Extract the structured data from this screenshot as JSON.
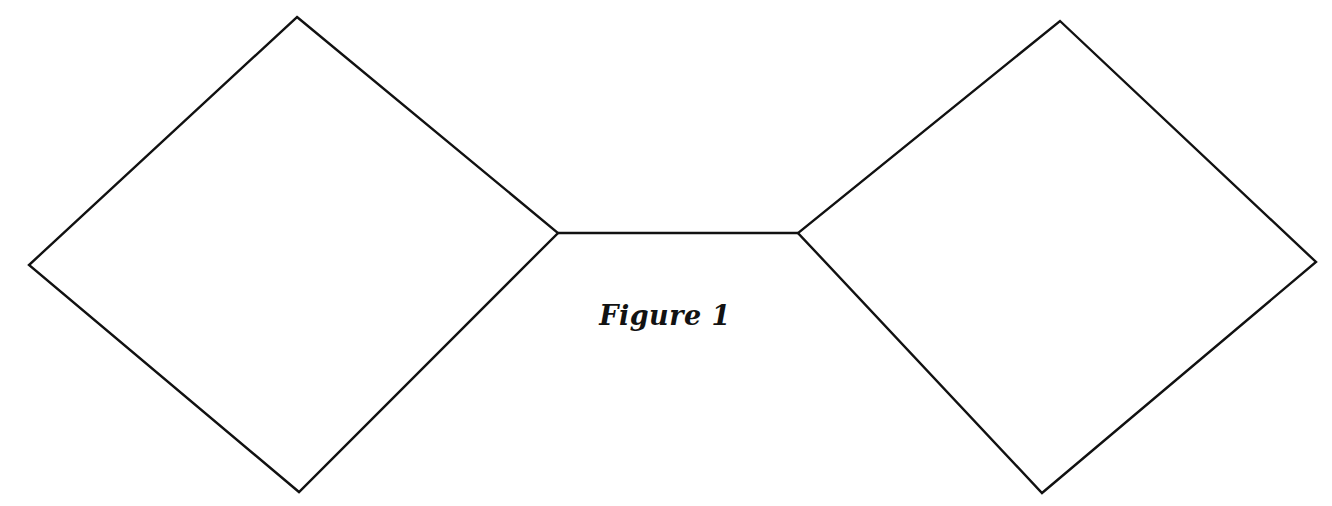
{
  "figure": {
    "caption": "Figure 1",
    "background_color": "#ffffff",
    "stroke_color": "#111111",
    "fill_color": "#ffffff",
    "stroke_width": 2.4,
    "caption_center_x": 683,
    "caption_baseline_y": 330
  },
  "chart_data": {
    "type": "diagram",
    "title": "Figure 1",
    "xlabel": "",
    "ylabel": "",
    "axis_ranges": {
      "x": [
        0,
        1332
      ],
      "y": [
        0,
        506
      ]
    },
    "grid": false,
    "legend": "none",
    "shapes": [
      {
        "name": "left-diamond",
        "kind": "square-rotated-45",
        "points": [
          [
            297,
            17
          ],
          [
            558,
            233
          ],
          [
            299,
            492
          ],
          [
            29,
            265
          ]
        ],
        "vertex_labels": [
          "top",
          "right",
          "bottom",
          "left"
        ],
        "closed": true,
        "fill": "#ffffff",
        "stroke": "#111111"
      },
      {
        "name": "right-diamond",
        "kind": "square-rotated-45",
        "points": [
          [
            1060,
            21
          ],
          [
            1316,
            262
          ],
          [
            1042,
            493
          ],
          [
            798,
            233
          ]
        ],
        "vertex_labels": [
          "top",
          "right",
          "bottom",
          "left"
        ],
        "closed": true,
        "fill": "#ffffff",
        "stroke": "#111111"
      },
      {
        "name": "connector",
        "kind": "segment",
        "points": [
          [
            558,
            233
          ],
          [
            798,
            233
          ]
        ],
        "closed": false,
        "stroke": "#111111"
      }
    ],
    "annotations": [
      {
        "name": "caption",
        "text": "Figure 1",
        "x": 683,
        "y": 319,
        "style": "bold-italic"
      }
    ]
  }
}
